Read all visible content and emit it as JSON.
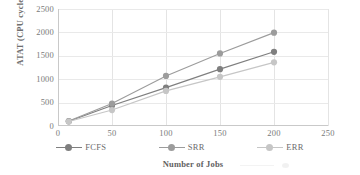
{
  "chart_data": {
    "type": "line",
    "title": "",
    "xlabel": "Number of Jobs",
    "ylabel": "ATAT (CPU cycles)",
    "x": [
      10,
      50,
      100,
      150,
      200
    ],
    "xlim": [
      0,
      250
    ],
    "ylim": [
      0,
      2500
    ],
    "xticks": [
      "0",
      "50",
      "100",
      "150",
      "200",
      "250"
    ],
    "yticks": [
      "0",
      "500",
      "1000",
      "1500",
      "2000",
      "2500"
    ],
    "grid": "both",
    "legend_position": "bottom",
    "series": [
      {
        "name": "FCFS",
        "color": "#7f7f7f",
        "values": [
          100,
          440,
          820,
          1215,
          1585
        ]
      },
      {
        "name": "SRR",
        "color": "#9c9c9c",
        "values": [
          105,
          480,
          1070,
          1550,
          1995
        ]
      },
      {
        "name": "ERR",
        "color": "#c6c6c6",
        "values": [
          95,
          340,
          750,
          1050,
          1360
        ]
      }
    ]
  },
  "axis": {
    "y_title": "ATAT (CPU cycles)",
    "x_title": "Number of Jobs"
  },
  "legend": {
    "items": [
      {
        "label": "FCFS"
      },
      {
        "label": "SRR"
      },
      {
        "label": "ERR"
      }
    ]
  }
}
